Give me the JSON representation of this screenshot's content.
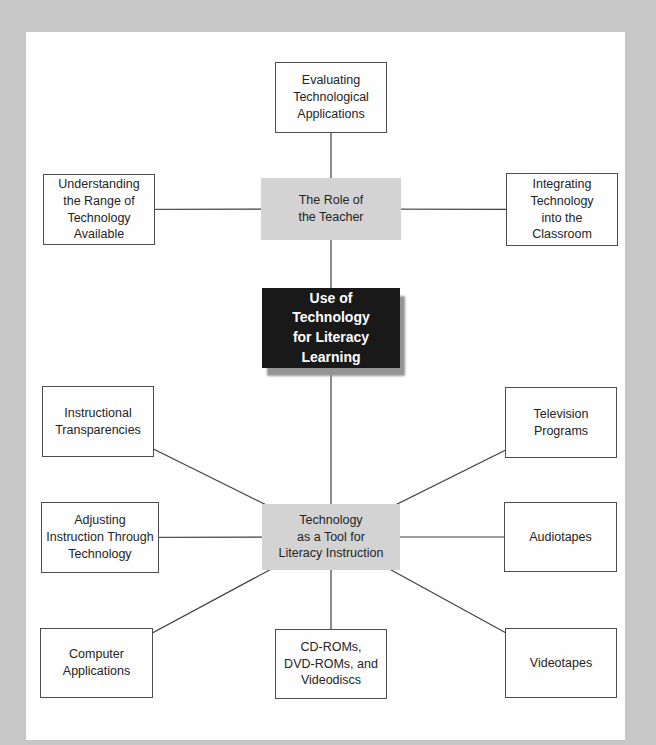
{
  "diagram": {
    "background_color": "#c7c7c7",
    "panel_color": "#fefefe",
    "line_color": "#3d3d3d",
    "gray_node_fill": "#d3d3d3",
    "black_node_fill": "#191919",
    "black_node_text_color": "#ffffff",
    "nodes": [
      {
        "id": "evaluating",
        "variant": "white",
        "label": "Evaluating\nTechnological\nApplications"
      },
      {
        "id": "understanding",
        "variant": "white",
        "label": "Understanding\nthe Range of\nTechnology\nAvailable"
      },
      {
        "id": "role",
        "variant": "gray",
        "label": "The Role of\nthe Teacher"
      },
      {
        "id": "integrating",
        "variant": "white",
        "label": "Integrating\nTechnology\ninto the\nClassroom"
      },
      {
        "id": "core",
        "variant": "black",
        "label": "Use of\nTechnology\nfor Literacy\nLearning"
      },
      {
        "id": "instructional",
        "variant": "white",
        "label": "Instructional\nTransparencies"
      },
      {
        "id": "television",
        "variant": "white",
        "label": "Television\nPrograms"
      },
      {
        "id": "adjusting",
        "variant": "white",
        "label": "Adjusting\nInstruction Through\nTechnology"
      },
      {
        "id": "tool",
        "variant": "gray",
        "label": "Technology\nas a Tool for\nLiteracy Instruction"
      },
      {
        "id": "audiotapes",
        "variant": "white",
        "label": "Audiotapes"
      },
      {
        "id": "computer",
        "variant": "white",
        "label": "Computer\nApplications"
      },
      {
        "id": "cdroms",
        "variant": "white",
        "label": "CD-ROMs,\nDVD-ROMs, and\nVideodiscs"
      },
      {
        "id": "videotapes",
        "variant": "white",
        "label": "Videotapes"
      }
    ],
    "edges": [
      {
        "from": "evaluating",
        "to": "role"
      },
      {
        "from": "understanding",
        "to": "role"
      },
      {
        "from": "integrating",
        "to": "role"
      },
      {
        "from": "role",
        "to": "core"
      },
      {
        "from": "core",
        "to": "tool"
      },
      {
        "from": "instructional",
        "to": "tool"
      },
      {
        "from": "adjusting",
        "to": "tool"
      },
      {
        "from": "computer",
        "to": "tool"
      },
      {
        "from": "cdroms",
        "to": "tool"
      },
      {
        "from": "television",
        "to": "tool"
      },
      {
        "from": "audiotapes",
        "to": "tool"
      },
      {
        "from": "videotapes",
        "to": "tool"
      }
    ]
  }
}
